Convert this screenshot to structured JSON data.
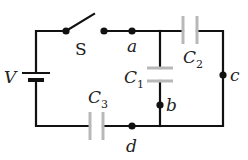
{
  "diagram": {
    "type": "circuit",
    "colors": {
      "wire": "#111111",
      "capacitor_plate": "#b8b8b8",
      "text": "#222222"
    },
    "labels": {
      "battery": "V",
      "switch": "S",
      "node_a": "a",
      "node_b": "b",
      "node_c": "c",
      "node_d": "d",
      "c1": "C",
      "c1_sub": "1",
      "c2": "C",
      "c2_sub": "2",
      "c3": "C",
      "c3_sub": "3"
    },
    "components": [
      {
        "id": "V",
        "kind": "battery",
        "position": "left branch"
      },
      {
        "id": "S",
        "kind": "switch",
        "state": "open",
        "position": "top wire"
      },
      {
        "id": "C1",
        "kind": "capacitor",
        "between": [
          "a",
          "b"
        ]
      },
      {
        "id": "C2",
        "kind": "capacitor",
        "between": [
          "a",
          "c"
        ]
      },
      {
        "id": "C3",
        "kind": "capacitor",
        "position": "bottom wire, left of d"
      }
    ],
    "nodes": [
      "a",
      "b",
      "c",
      "d"
    ]
  }
}
